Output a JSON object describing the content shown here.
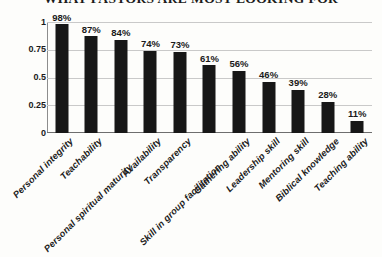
{
  "chart_data": {
    "type": "bar",
    "title": "WHAT PASTORS ARE MOST LOOKING FOR",
    "xlabel": "",
    "ylabel": "",
    "ylim": [
      0,
      1
    ],
    "grid": true,
    "legend": false,
    "orientation": "vertical",
    "bar_color": "#171717",
    "y_ticks": [
      "0",
      "0.25",
      "0.5",
      "0.75",
      "1"
    ],
    "y_tick_values": [
      0,
      0.25,
      0.5,
      0.75,
      1
    ],
    "categories": [
      "Personal integrity",
      "Teachability",
      "Personal spiritual maturity",
      "Availability",
      "Transparency",
      "Skill in group facilitation",
      "Gathering ability",
      "Leadership skill",
      "Mentoring skill",
      "Biblical knowledge",
      "Teaching ability"
    ],
    "values": [
      0.98,
      0.87,
      0.84,
      0.74,
      0.73,
      0.61,
      0.56,
      0.46,
      0.39,
      0.28,
      0.11
    ],
    "data_labels": [
      "98%",
      "87%",
      "84%",
      "74%",
      "73%",
      "61%",
      "56%",
      "46%",
      "39%",
      "28%",
      "11%"
    ]
  }
}
